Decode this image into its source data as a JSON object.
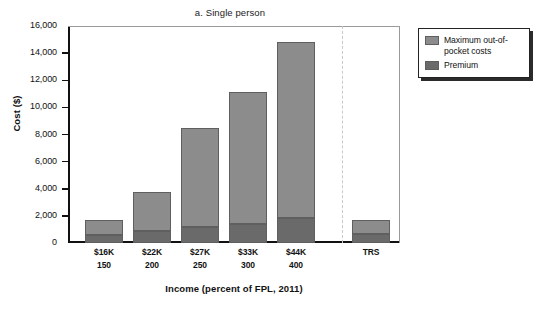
{
  "chart_data": {
    "type": "bar",
    "subtype": "stacked-bar",
    "title": "a. Single person",
    "xlabel": "Income (percent of FPL, 2011)",
    "ylabel": "Cost ($)",
    "ylim": [
      0,
      16000
    ],
    "ytick_step": 2000,
    "ytick_labels": [
      "16,000",
      "14,000",
      "12,000",
      "10,000",
      "8,000",
      "6,000",
      "4,000",
      "2,000",
      "0"
    ],
    "ytick_values": [
      16000,
      14000,
      12000,
      10000,
      8000,
      6000,
      4000,
      2000,
      0
    ],
    "grid": false,
    "legend_position": "right",
    "categories": [
      {
        "income": "$16K",
        "fpl": "150"
      },
      {
        "income": "$22K",
        "fpl": "200"
      },
      {
        "income": "$27K",
        "fpl": "250"
      },
      {
        "income": "$33K",
        "fpl": "300"
      },
      {
        "income": "$44K",
        "fpl": "400"
      },
      {
        "income": "TRS",
        "fpl": ""
      }
    ],
    "series": [
      {
        "name": "Premium",
        "color": "#6a6a6a",
        "values": [
          620,
          870,
          1180,
          1400,
          1850,
          660
        ]
      },
      {
        "name": "Maximum out-of-pocket costs",
        "color": "#8c8c8c",
        "values": [
          1050,
          2880,
          7280,
          9720,
          12980,
          1010
        ]
      }
    ],
    "totals": [
      1670,
      3750,
      8460,
      11120,
      14830,
      1670
    ],
    "annotations": {
      "divider": "dashed vertical line separating exchange income groups from TRS"
    }
  },
  "legend": {
    "items": [
      {
        "label": "Maximum out-of-pocket costs",
        "color": "#8c8c8c"
      },
      {
        "label": "Premium",
        "color": "#6a6a6a"
      }
    ]
  }
}
